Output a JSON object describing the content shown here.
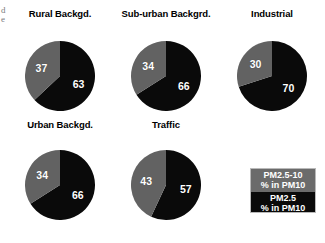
{
  "figure": {
    "width": 325,
    "height": 243,
    "background": "#ffffff",
    "edge_fragment_1": "d",
    "edge_fragment_2": "e"
  },
  "colors": {
    "coarse_gray": "#626262",
    "fine_black": "#0a0a0a",
    "label_text": "#ffffff",
    "title_text": "#000000",
    "legend_border": "#b9b9b9",
    "legend_gray": "#6b6b6b",
    "legend_black": "#0a0a0a"
  },
  "legend": {
    "gray": {
      "line1": "PM2.5-10",
      "line2": "% in PM10"
    },
    "black": {
      "line1": "PM2.5",
      "line2": "% in PM10"
    }
  },
  "chart_data": {
    "type": "pie",
    "title": "",
    "subtitle": "",
    "xlabel": "",
    "ylabel": "",
    "legend_position": "bottom-right",
    "grid": false,
    "units": "% in PM10",
    "slice_names": [
      "PM2.5-10 % in PM10",
      "PM2.5 % in PM10"
    ],
    "slice_colors": [
      "#626262",
      "#0a0a0a"
    ],
    "charts": [
      {
        "title": "Rural Backgd.",
        "labels": [
          "PM2.5-10",
          "PM2.5"
        ],
        "values": [
          37,
          63
        ],
        "coarse": 37,
        "fine": 63,
        "coarse_label": "37",
        "fine_label": "63"
      },
      {
        "title": "Sub-urban Backgrd.",
        "labels": [
          "PM2.5-10",
          "PM2.5"
        ],
        "values": [
          34,
          66
        ],
        "coarse": 34,
        "fine": 66,
        "coarse_label": "34",
        "fine_label": "66"
      },
      {
        "title": "Industrial",
        "labels": [
          "PM2.5-10",
          "PM2.5"
        ],
        "values": [
          30,
          70
        ],
        "coarse": 30,
        "fine": 70,
        "coarse_label": "30",
        "fine_label": "70"
      },
      {
        "title": "Urban Backgd.",
        "labels": [
          "PM2.5-10",
          "PM2.5"
        ],
        "values": [
          34,
          66
        ],
        "coarse": 34,
        "fine": 66,
        "coarse_label": "34",
        "fine_label": "66"
      },
      {
        "title": "Traffic",
        "labels": [
          "PM2.5-10",
          "PM2.5"
        ],
        "values": [
          43,
          57
        ],
        "coarse": 43,
        "fine": 57,
        "coarse_label": "43",
        "fine_label": "57"
      }
    ]
  },
  "layout": {
    "radius": 35,
    "cells": [
      {
        "cx": 60,
        "titleTop": 8,
        "pieTop": 41
      },
      {
        "cx": 166,
        "titleTop": 8,
        "pieTop": 41
      },
      {
        "cx": 272,
        "titleTop": 8,
        "pieTop": 41
      },
      {
        "cx": 60,
        "titleTop": 119,
        "pieTop": 150
      },
      {
        "cx": 166,
        "titleTop": 119,
        "pieTop": 150
      }
    ],
    "legend": {
      "left": 250,
      "top": 168,
      "width": 66,
      "height": 45
    }
  }
}
